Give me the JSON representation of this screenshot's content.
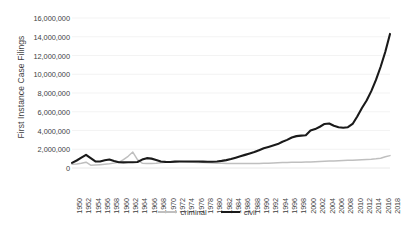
{
  "chart_data": {
    "type": "line",
    "title": "",
    "subtitle": "",
    "xlabel": "",
    "ylabel": "First Instance Case Filings",
    "ylim": [
      0,
      16000000
    ],
    "ytick_step": 2000000,
    "grid": true,
    "legend_position": "bottom",
    "ytick_labels": [
      "16,000,000",
      "14,000,000",
      "12,000,000",
      "10,000,000",
      "8,000,000",
      "6,000,000",
      "4,000,000",
      "2,000,000",
      "0"
    ],
    "ytick_values": [
      16000000,
      14000000,
      12000000,
      10000000,
      8000000,
      6000000,
      4000000,
      2000000,
      0
    ],
    "xlim": [
      1950,
      2018
    ],
    "xtick_step": 2,
    "xtick_labels": [
      "1950",
      "1952",
      "1954",
      "1956",
      "1958",
      "1960",
      "1962",
      "1964",
      "1966",
      "1968",
      "1970",
      "1972",
      "1974",
      "1976",
      "1978",
      "1980",
      "1982",
      "1984",
      "1986",
      "1988",
      "1990",
      "1992",
      "1994",
      "1996",
      "1998",
      "2000",
      "2002",
      "2004",
      "2006",
      "2008",
      "2010",
      "2012",
      "2014",
      "2016",
      "2018"
    ],
    "x": [
      1950,
      1951,
      1952,
      1953,
      1954,
      1955,
      1956,
      1957,
      1958,
      1959,
      1960,
      1961,
      1962,
      1963,
      1964,
      1965,
      1966,
      1967,
      1968,
      1969,
      1970,
      1971,
      1972,
      1973,
      1974,
      1975,
      1976,
      1977,
      1978,
      1979,
      1980,
      1981,
      1982,
      1983,
      1984,
      1985,
      1986,
      1987,
      1988,
      1989,
      1990,
      1991,
      1992,
      1993,
      1994,
      1995,
      1996,
      1997,
      1998,
      1999,
      2000,
      2001,
      2002,
      2003,
      2004,
      2005,
      2006,
      2007,
      2008,
      2009,
      2010,
      2011,
      2012,
      2013,
      2014,
      2015,
      2016,
      2017,
      2018
    ],
    "series": [
      {
        "name": "criminal",
        "color": "#bfbfbf",
        "line_width": 1.5,
        "values": [
          400000,
          430000,
          500000,
          620000,
          300000,
          330000,
          360000,
          400000,
          450000,
          520000,
          600000,
          900000,
          1250000,
          1700000,
          900000,
          520000,
          480000,
          470000,
          500000,
          560000,
          620000,
          660000,
          700000,
          700000,
          660000,
          640000,
          620000,
          600000,
          580000,
          560000,
          540000,
          520000,
          500000,
          490000,
          480000,
          470000,
          470000,
          470000,
          480000,
          480000,
          490000,
          500000,
          520000,
          540000,
          560000,
          580000,
          600000,
          610000,
          620000,
          620000,
          640000,
          650000,
          670000,
          700000,
          720000,
          740000,
          760000,
          780000,
          800000,
          820000,
          830000,
          850000,
          880000,
          900000,
          930000,
          980000,
          1050000,
          1200000,
          1320000
        ]
      },
      {
        "name": "civil",
        "color": "#1a1a1a",
        "line_width": 2.1,
        "values": [
          550000,
          800000,
          1100000,
          1400000,
          1050000,
          700000,
          700000,
          820000,
          900000,
          750000,
          620000,
          600000,
          620000,
          620000,
          640000,
          900000,
          1050000,
          1000000,
          860000,
          700000,
          650000,
          640000,
          680000,
          700000,
          700000,
          700000,
          700000,
          690000,
          680000,
          660000,
          660000,
          700000,
          760000,
          840000,
          950000,
          1100000,
          1250000,
          1400000,
          1550000,
          1700000,
          1900000,
          2100000,
          2250000,
          2400000,
          2550000,
          2800000,
          3000000,
          3250000,
          3400000,
          3450000,
          3500000,
          4000000,
          4150000,
          4400000,
          4700000,
          4750000,
          4500000,
          4350000,
          4300000,
          4350000,
          4700000,
          5500000,
          6400000,
          7200000,
          8200000,
          9400000,
          10800000,
          12400000,
          14300000
        ]
      }
    ]
  },
  "legend": {
    "items": [
      {
        "label": "criminal",
        "style": "criminal"
      },
      {
        "label": "civil",
        "style": "civil"
      }
    ]
  },
  "colors": {
    "background": "#ffffff",
    "gridline": "#f0f0f0",
    "text": "#3f3f3f",
    "civil": "#1a1a1a",
    "criminal": "#bfbfbf"
  }
}
